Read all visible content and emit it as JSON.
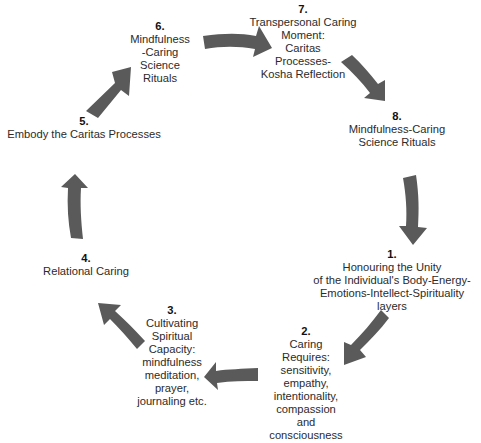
{
  "diagram": {
    "type": "cycle",
    "arrow_color": "#5a5a5a",
    "text_color": "#2b2b2b",
    "background": "#ffffff",
    "steps": [
      {
        "number": "1.",
        "label": "Honouring the Unity\nof the Individual's Body-Energy-\nEmotions-Intellect-Spirituality layers"
      },
      {
        "number": "2.",
        "label": "Caring\nRequires:\nsensitivity,\nempathy,\nintentionality,\ncompassion\nand\nconsciousness"
      },
      {
        "number": "3.",
        "label": "Cultivating\nSpiritual\nCapacity:\nmindfulness\nmeditation,\nprayer,\njournaling etc."
      },
      {
        "number": "4.",
        "label": "Relational Caring"
      },
      {
        "number": "5.",
        "label": "Embody the Caritas Processes"
      },
      {
        "number": "6.",
        "label": "Mindfulness\n-Caring\nScience\nRituals"
      },
      {
        "number": "7.",
        "label": "Transpersonal Caring\nMoment:\nCaritas\nProcesses-\nKosha Reflection"
      },
      {
        "number": "8.",
        "label": "Mindfulness-Caring\nScience Rituals"
      }
    ],
    "connections": [
      {
        "from": "1",
        "to": "2"
      },
      {
        "from": "2",
        "to": "3"
      },
      {
        "from": "3",
        "to": "4"
      },
      {
        "from": "4",
        "to": "5"
      },
      {
        "from": "5",
        "to": "6"
      },
      {
        "from": "6",
        "to": "7"
      },
      {
        "from": "7",
        "to": "8"
      },
      {
        "from": "8",
        "to": "1"
      }
    ]
  }
}
